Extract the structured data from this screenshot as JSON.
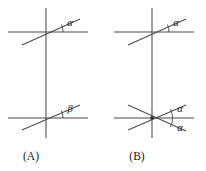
{
  "figure": {
    "background_color": "#ffffff",
    "stroke_color": "#4a4a4a",
    "text_color": "#1a1a1a",
    "panels": [
      {
        "id": "panel-a",
        "caption": "(A)",
        "vertical_line": {
          "x": 46,
          "y1": 8,
          "y2": 138
        },
        "intersections": [
          {
            "id": "a-top",
            "x": 46,
            "y": 32,
            "horizontal_line": {
              "x1": 8,
              "x2": 88,
              "y": 32
            },
            "transversal": {
              "x1": 22,
              "y1": 45,
              "x2": 80,
              "y2": 19
            },
            "angle_label": "α",
            "angle_label_x": 70,
            "angle_label_y": 26,
            "arc_radius": 17,
            "has_node_dot": false
          },
          {
            "id": "a-bottom",
            "x": 46,
            "y": 118,
            "horizontal_line": {
              "x1": 8,
              "x2": 88,
              "y": 118
            },
            "transversal": {
              "x1": 22,
              "y1": 130,
              "x2": 80,
              "y2": 105
            },
            "angle_label": "β",
            "angle_label_x": 70,
            "angle_label_y": 112,
            "arc_radius": 17,
            "has_node_dot": false
          }
        ]
      },
      {
        "id": "panel-b",
        "caption": "(B)",
        "vertical_line": {
          "x": 152,
          "y1": 8,
          "y2": 138
        },
        "intersections": [
          {
            "id": "b-top",
            "x": 152,
            "y": 32,
            "horizontal_line": {
              "x1": 114,
              "x2": 194,
              "y": 32
            },
            "transversal": {
              "x1": 128,
              "y1": 45,
              "x2": 186,
              "y2": 19
            },
            "angle_label": "α",
            "angle_label_x": 176,
            "angle_label_y": 26,
            "arc_radius": 17,
            "has_node_dot": false
          },
          {
            "id": "b-bottom",
            "x": 152,
            "y": 118,
            "horizontal_line": {
              "x1": 114,
              "x2": 194,
              "y": 118
            },
            "transversal": {
              "x1": 128,
              "y1": 130,
              "x2": 186,
              "y2": 105
            },
            "transversal_2": {
              "x1": 128,
              "y1": 105,
              "x2": 186,
              "y2": 131
            },
            "angle_label": "α",
            "angle_label_x": 178,
            "angle_label_y": 112,
            "angle_label_2": "α",
            "angle_label_2_x": 178,
            "angle_label_2_y": 130,
            "arc_radius": 19,
            "arc_radius_2": 21,
            "has_node_dot": true
          }
        ]
      }
    ],
    "captions": [
      {
        "text": "(A)",
        "x": 31,
        "y": 160
      },
      {
        "text": "(B)",
        "x": 137,
        "y": 160
      }
    ]
  }
}
